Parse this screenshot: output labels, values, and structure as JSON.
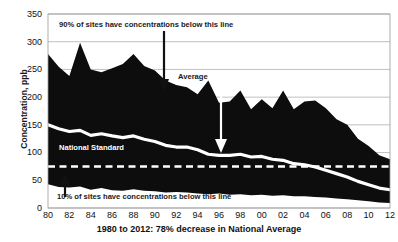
{
  "chart_data": {
    "type": "area",
    "title": "1980 to 2012: 78% decrease in National Average",
    "xlabel": "1980 to 2012: 78% decrease in National Average",
    "ylabel": "Concentration, ppb",
    "ylim": [
      0,
      350
    ],
    "ytick_labels": [
      "0",
      "50",
      "100",
      "150",
      "200",
      "250",
      "300",
      "350"
    ],
    "ytick_values": [
      0,
      50,
      100,
      150,
      200,
      250,
      300,
      350
    ],
    "xtick_labels": [
      "80",
      "82",
      "84",
      "86",
      "88",
      "90",
      "92",
      "94",
      "96",
      "98",
      "00",
      "02",
      "04",
      "06",
      "08",
      "10",
      "12"
    ],
    "x": [
      1980,
      1981,
      1982,
      1983,
      1984,
      1985,
      1986,
      1987,
      1988,
      1989,
      1990,
      1991,
      1992,
      1993,
      1994,
      1995,
      1996,
      1997,
      1998,
      1999,
      2000,
      2001,
      2002,
      2003,
      2004,
      2005,
      2006,
      2007,
      2008,
      2009,
      2010,
      2011,
      2012
    ],
    "grid": true,
    "legend_position": "none",
    "series": [
      {
        "name": "90th Percentile",
        "values": [
          278,
          255,
          238,
          298,
          250,
          245,
          252,
          260,
          278,
          256,
          248,
          230,
          222,
          218,
          205,
          230,
          190,
          192,
          212,
          178,
          196,
          180,
          212,
          178,
          192,
          194,
          180,
          160,
          150,
          125,
          112,
          95,
          88
        ]
      },
      {
        "name": "Average",
        "values": [
          150,
          143,
          138,
          140,
          131,
          134,
          130,
          127,
          130,
          124,
          120,
          113,
          110,
          110,
          105,
          97,
          95,
          95,
          97,
          92,
          93,
          88,
          86,
          80,
          78,
          74,
          68,
          62,
          56,
          48,
          42,
          36,
          33
        ]
      },
      {
        "name": "10th Percentile",
        "values": [
          43,
          38,
          37,
          39,
          33,
          36,
          32,
          31,
          34,
          31,
          30,
          28,
          29,
          28,
          26,
          25,
          26,
          24,
          25,
          23,
          24,
          22,
          23,
          21,
          21,
          20,
          19,
          17,
          16,
          14,
          12,
          10,
          9
        ]
      },
      {
        "name": "National Standard",
        "values": [
          75,
          75,
          75,
          75,
          75,
          75,
          75,
          75,
          75,
          75,
          75,
          75,
          75,
          75,
          75,
          75,
          75,
          75,
          75,
          75,
          75,
          75,
          75,
          75,
          75,
          75,
          75,
          75,
          75,
          75,
          75,
          75,
          75
        ]
      }
    ],
    "annotations": [
      {
        "id": "upper-band-note",
        "text": "90% of sites have concentrations below this line"
      },
      {
        "id": "average-note",
        "text": "Average"
      },
      {
        "id": "national-standard-note",
        "text": "National Standard"
      },
      {
        "id": "lower-band-note",
        "text": "10% of sites have concentrations below this line"
      }
    ],
    "colors": {
      "band_fill": "#0d0d0d",
      "average_line": "#ffffff",
      "standard_line": "#ffffff",
      "gridline": "#b0b0b0",
      "text": "#111111",
      "background": "#ffffff"
    }
  }
}
